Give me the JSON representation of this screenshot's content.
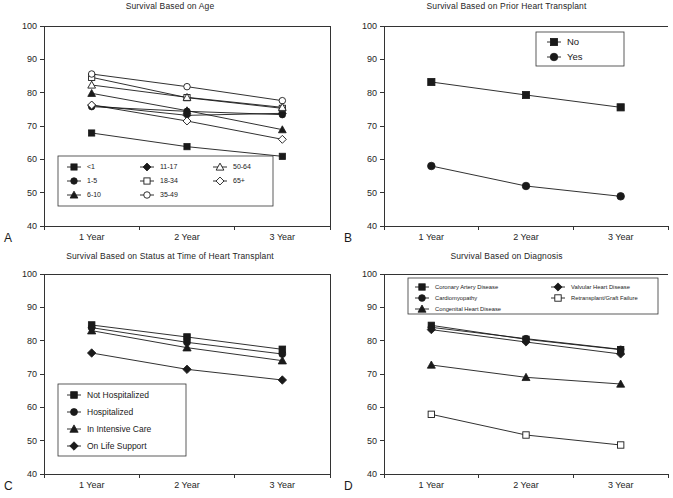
{
  "figure": {
    "background": "#ffffff",
    "line_color": "#1a1a1a",
    "axis_color": "#333333"
  },
  "axis": {
    "y_ticks": [
      "100",
      "90",
      "80",
      "70",
      "60",
      "50",
      "40"
    ],
    "x_ticks": [
      "1 Year",
      "2 Year",
      "3 Year"
    ],
    "ylim_min": 40,
    "ylim_max": 100
  },
  "panels": {
    "a": {
      "letter": "A",
      "title": "Survival Based on Age",
      "legend": [
        {
          "label": "<1",
          "marker": "filled-square"
        },
        {
          "label": "1-5",
          "marker": "filled-circle"
        },
        {
          "label": "6-10",
          "marker": "filled-triangle"
        },
        {
          "label": "11-17",
          "marker": "filled-diamond"
        },
        {
          "label": "18-34",
          "marker": "open-square"
        },
        {
          "label": "35-49",
          "marker": "open-circle"
        },
        {
          "label": "50-64",
          "marker": "open-triangle"
        },
        {
          "label": "65+",
          "marker": "open-diamond"
        }
      ]
    },
    "b": {
      "letter": "B",
      "title": "Survival Based on Prior Heart Transplant",
      "legend": [
        {
          "label": "No",
          "marker": "filled-square"
        },
        {
          "label": "Yes",
          "marker": "filled-circle"
        }
      ]
    },
    "c": {
      "letter": "C",
      "title": "Survival Based on Status at Time of Heart Transplant",
      "legend": [
        {
          "label": "Not Hospitalized",
          "marker": "filled-square"
        },
        {
          "label": "Hospitalized",
          "marker": "filled-circle"
        },
        {
          "label": "In Intensive Care",
          "marker": "filled-triangle"
        },
        {
          "label": "On Life Support",
          "marker": "filled-diamond"
        }
      ]
    },
    "d": {
      "letter": "D",
      "title": "Survival Based on Diagnosis",
      "legend": [
        {
          "label": "Coronary Artery Disease",
          "marker": "filled-square"
        },
        {
          "label": "Cardiomyopathy",
          "marker": "filled-circle"
        },
        {
          "label": "Congenital Heart Disease",
          "marker": "filled-triangle"
        },
        {
          "label": "Valvular Heart Disease",
          "marker": "filled-diamond"
        },
        {
          "label": "Retransplant/Graft Failure",
          "marker": "open-square"
        }
      ]
    }
  },
  "chart_data": [
    {
      "panel": "A",
      "type": "line",
      "title": "Survival Based on Age",
      "xlabel": "",
      "ylabel": "",
      "categories": [
        "1 Year",
        "2 Year",
        "3 Year"
      ],
      "ylim": [
        40,
        100
      ],
      "grid": false,
      "legend_position": "inside-bottom-left",
      "series": [
        {
          "name": "<1",
          "marker": "filled-square",
          "values": [
            67.9,
            63.8,
            60.9
          ]
        },
        {
          "name": "1-5",
          "marker": "filled-circle",
          "values": [
            75.8,
            74.4,
            73.4
          ]
        },
        {
          "name": "6-10",
          "marker": "filled-triangle",
          "values": [
            79.8,
            74.6,
            68.9
          ]
        },
        {
          "name": "11-17",
          "marker": "filled-diamond",
          "values": [
            76.2,
            73.2,
            73.8
          ]
        },
        {
          "name": "18-34",
          "marker": "open-square",
          "values": [
            84.6,
            78.5,
            75.3
          ]
        },
        {
          "name": "35-49",
          "marker": "open-circle",
          "values": [
            85.6,
            81.8,
            77.6
          ]
        },
        {
          "name": "50-64",
          "marker": "open-triangle",
          "values": [
            82.3,
            78.6,
            75.6
          ]
        },
        {
          "name": "65+",
          "marker": "open-diamond",
          "values": [
            76.3,
            71.5,
            66.0
          ]
        }
      ]
    },
    {
      "panel": "B",
      "type": "line",
      "title": "Survival Based on Prior Heart Transplant",
      "xlabel": "",
      "ylabel": "",
      "categories": [
        "1 Year",
        "2 Year",
        "3 Year"
      ],
      "ylim": [
        40,
        100
      ],
      "grid": false,
      "legend_position": "inside-top-right",
      "series": [
        {
          "name": "No",
          "marker": "filled-square",
          "values": [
            83.2,
            79.3,
            75.6
          ]
        },
        {
          "name": "Yes",
          "marker": "filled-circle",
          "values": [
            58.0,
            52.0,
            48.9
          ]
        }
      ]
    },
    {
      "panel": "C",
      "type": "line",
      "title": "Survival Based on Status at Time of Heart Transplant",
      "xlabel": "",
      "ylabel": "",
      "categories": [
        "1 Year",
        "2 Year",
        "3 Year"
      ],
      "ylim": [
        40,
        100
      ],
      "grid": false,
      "legend_position": "inside-bottom-left",
      "series": [
        {
          "name": "Not Hospitalized",
          "marker": "filled-square",
          "values": [
            84.7,
            81.1,
            77.4
          ]
        },
        {
          "name": "Hospitalized",
          "marker": "filled-circle",
          "values": [
            83.9,
            79.5,
            76.0
          ]
        },
        {
          "name": "In Intensive Care",
          "marker": "filled-triangle",
          "values": [
            83.0,
            77.9,
            74.0
          ]
        },
        {
          "name": "On Life Support",
          "marker": "filled-diamond",
          "values": [
            76.3,
            71.4,
            68.2
          ]
        }
      ]
    },
    {
      "panel": "D",
      "type": "line",
      "title": "Survival Based on Diagnosis",
      "xlabel": "",
      "ylabel": "",
      "categories": [
        "1 Year",
        "2 Year",
        "3 Year"
      ],
      "ylim": [
        40,
        100
      ],
      "grid": false,
      "legend_position": "inside-top",
      "series": [
        {
          "name": "Coronary Artery Disease",
          "marker": "filled-square",
          "values": [
            84.6,
            80.4,
            77.3
          ]
        },
        {
          "name": "Cardiomyopathy",
          "marker": "filled-circle",
          "values": [
            84.0,
            80.6,
            77.4
          ]
        },
        {
          "name": "Congenital Heart Disease",
          "marker": "filled-triangle",
          "values": [
            72.7,
            69.0,
            67.0
          ]
        },
        {
          "name": "Valvular Heart Disease",
          "marker": "filled-diamond",
          "values": [
            83.3,
            79.6,
            76.0
          ]
        },
        {
          "name": "Retransplant/Graft Failure",
          "marker": "open-square",
          "values": [
            57.9,
            51.7,
            48.7
          ]
        }
      ]
    }
  ]
}
